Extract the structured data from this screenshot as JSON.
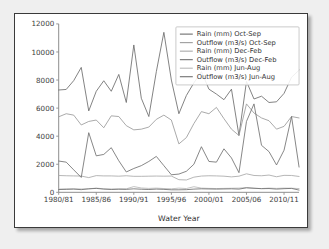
{
  "figure": {
    "background": "#ffffff",
    "frame_color": "#3a3a3a"
  },
  "chart_data": {
    "type": "line",
    "title": "",
    "xlabel": "Water Year",
    "ylabel": "",
    "ylim": [
      0,
      12000
    ],
    "ytick_values": [
      0,
      2000,
      4000,
      6000,
      8000,
      10000,
      12000
    ],
    "ytick_labels": [
      "0",
      "2000",
      "4000",
      "6000",
      "8000",
      "10000",
      "12000"
    ],
    "grid": false,
    "legend_position": "upper right",
    "x": [
      "1980/81",
      "1981/82",
      "1982/83",
      "1983/84",
      "1984/85",
      "1985/86",
      "1986/87",
      "1987/88",
      "1988/89",
      "1989/90",
      "1990/91",
      "1991/92",
      "1992/93",
      "1993/94",
      "1994/95",
      "1995/96",
      "1996/97",
      "1997/98",
      "1998/99",
      "1999/00",
      "2000/01",
      "2001/02",
      "2002/03",
      "2003/04",
      "2004/05",
      "2005/06",
      "2006/07",
      "2007/08",
      "2008/09",
      "2009/10",
      "2010/11",
      "2011/12",
      "2012/13"
    ],
    "xtick_labels": [
      "1980/81",
      "1985/86",
      "1990/91",
      "1995/96",
      "2000/01",
      "2005/06",
      "2010/11"
    ],
    "xtick_indices": [
      0,
      5,
      10,
      15,
      20,
      25,
      30
    ],
    "series": [
      {
        "name": "Rain (mm) Oct-Sep",
        "color": "#6b6b6b",
        "values": [
          7290,
          7330,
          7960,
          8900,
          5800,
          7200,
          7950,
          7200,
          8400,
          6400,
          10500,
          6700,
          5400,
          8600,
          11400,
          8000,
          5600,
          6900,
          7800,
          8600,
          7350,
          7000,
          6600,
          7350,
          4050,
          7900,
          6650,
          6850,
          6400,
          6450,
          7050,
          8200,
          8700
        ]
      },
      {
        "name": "Outflow (m3/s) Oct-Sep",
        "color": "#9a9a9a",
        "values": [
          5380,
          5600,
          5500,
          4800,
          5050,
          5150,
          4600,
          5450,
          5400,
          4750,
          4450,
          4500,
          4650,
          5200,
          5500,
          5150,
          3450,
          3900,
          4900,
          5750,
          5600,
          6050,
          5250,
          4500,
          4050,
          6300,
          5650,
          5300,
          5100,
          4500,
          4700,
          5400,
          5300
        ]
      },
      {
        "name": "Rain (mm) Dec-Feb",
        "color": "#a8a8a8",
        "values": [
          1200,
          1180,
          1170,
          1160,
          1050,
          1190,
          1170,
          1170,
          1150,
          1180,
          1140,
          1140,
          1150,
          1160,
          1150,
          1160,
          900,
          880,
          1080,
          1160,
          1180,
          1170,
          1150,
          1100,
          1150,
          1320,
          1200,
          1180,
          1230,
          1110,
          1210,
          1200,
          1130
        ]
      },
      {
        "name": "Outflow (m3/s) Dec-Feb",
        "color": "#707070",
        "values": [
          2230,
          2150,
          1600,
          1060,
          4250,
          2600,
          2700,
          3180,
          2250,
          1450,
          1700,
          1900,
          2200,
          2560,
          1900,
          1250,
          1300,
          1500,
          2000,
          3250,
          2200,
          2150,
          3100,
          2450,
          1400,
          5050,
          6300,
          3350,
          2900,
          1950,
          3000,
          5400,
          1800
        ]
      },
      {
        "name": "Rain (mm) Jun-Aug",
        "color": "#b8b8b8",
        "values": [
          230,
          250,
          250,
          240,
          250,
          300,
          250,
          240,
          250,
          250,
          410,
          310,
          280,
          300,
          270,
          250,
          300,
          270,
          400,
          300,
          280,
          270,
          280,
          290,
          300,
          340,
          290,
          270,
          300,
          280,
          300,
          290,
          270
        ]
      },
      {
        "name": "Outflow (m3/s) Jun-Aug",
        "color": "#6f6f6f",
        "values": [
          200,
          210,
          230,
          190,
          250,
          280,
          230,
          200,
          220,
          210,
          250,
          220,
          200,
          230,
          210,
          180,
          180,
          190,
          230,
          250,
          240,
          230,
          240,
          250,
          230,
          320,
          290,
          260,
          270,
          230,
          260,
          280,
          160
        ]
      }
    ]
  }
}
